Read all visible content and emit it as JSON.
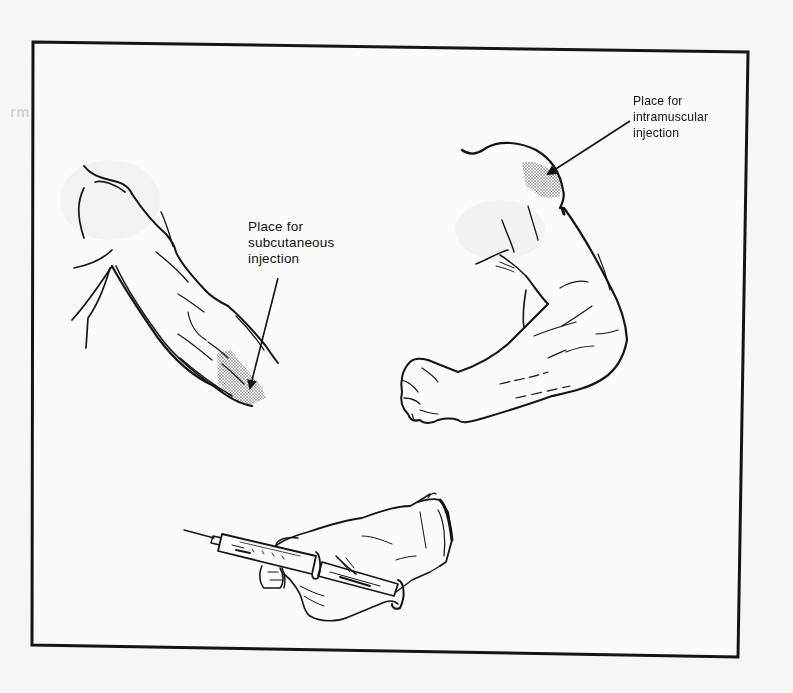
{
  "figure": {
    "type": "medical-illustration",
    "labels": {
      "subcutaneous": {
        "line1": "Place for",
        "line2": "subcutaneous",
        "line3": "injection"
      },
      "intramuscular": {
        "line1": "Place for",
        "line2": "intramuscular",
        "line3": "injection"
      }
    },
    "bleedthrough": {
      "line1": "row's bandages on different parts of the body",
      "line2": "rm sling"
    },
    "colors": {
      "paper": "#f6f6f4",
      "ink": "#111111",
      "stipple": "#555555"
    }
  }
}
